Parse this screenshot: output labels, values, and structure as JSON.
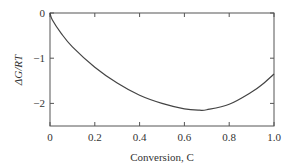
{
  "chart_data": {
    "type": "line",
    "title": "",
    "xlabel": "Conversion, C",
    "ylabel": "ΔG/RT",
    "xlim": [
      0,
      1.0
    ],
    "ylim": [
      -2.5,
      0
    ],
    "grid": false,
    "legend": null,
    "x_ticks": [
      "0",
      "0.2",
      "0.4",
      "0.6",
      "0.8",
      "1.0"
    ],
    "y_ticks": [
      "0",
      "−1",
      "−2"
    ],
    "series": [
      {
        "name": "ΔG/RT",
        "x": [
          0,
          0.01,
          0.05,
          0.1,
          0.2,
          0.3,
          0.4,
          0.5,
          0.6,
          0.667,
          0.7,
          0.8,
          0.9,
          0.95,
          1.0
        ],
        "values": [
          0,
          -0.15,
          -0.45,
          -0.75,
          -1.2,
          -1.55,
          -1.82,
          -2.0,
          -2.12,
          -2.15,
          -2.14,
          -2.02,
          -1.75,
          -1.57,
          -1.35
        ]
      }
    ]
  }
}
